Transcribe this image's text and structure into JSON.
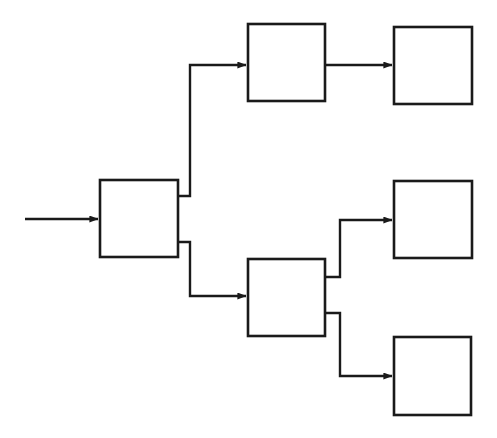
{
  "diagram": {
    "type": "flowchart",
    "orientation": "left-to-right",
    "canvas": {
      "width": 497,
      "height": 438,
      "background": "#ffffff"
    },
    "style": {
      "stroke_color": "#1a1a1a",
      "box_fill": "#ffffff",
      "box_stroke_width": 2.6,
      "edge_stroke_width": 2.4,
      "arrowhead": "solid-triangle"
    },
    "nodes": [
      {
        "id": "n1",
        "name": "root-block",
        "label": "",
        "x": 100,
        "y": 180,
        "width": 78,
        "height": 77
      },
      {
        "id": "n2",
        "name": "upper-branch-block",
        "label": "",
        "x": 248,
        "y": 24,
        "width": 77,
        "height": 77
      },
      {
        "id": "n3",
        "name": "upper-terminal-block",
        "label": "",
        "x": 394,
        "y": 27,
        "width": 78,
        "height": 77
      },
      {
        "id": "n4",
        "name": "lower-branch-block",
        "label": "",
        "x": 248,
        "y": 259,
        "width": 77,
        "height": 77
      },
      {
        "id": "n5",
        "name": "lower-upper-terminal-block",
        "label": "",
        "x": 394,
        "y": 181,
        "width": 78,
        "height": 77
      },
      {
        "id": "n6",
        "name": "lower-lower-terminal-block",
        "label": "",
        "x": 394,
        "y": 337,
        "width": 77,
        "height": 78
      }
    ],
    "edges": [
      {
        "id": "e0",
        "name": "input-arrow",
        "label": "",
        "from": "input",
        "to": "n1",
        "kind": "straight",
        "points": "25,219 98,219"
      },
      {
        "id": "e1",
        "name": "root-to-upper-branch-edge",
        "label": "",
        "from": "n1",
        "to": "n2",
        "kind": "orthogonal",
        "points": "178,196 190,196 190,65 246,65"
      },
      {
        "id": "e2",
        "name": "root-to-lower-branch-edge",
        "label": "",
        "from": "n1",
        "to": "n4",
        "kind": "orthogonal",
        "points": "178,242 190,242 190,296 246,296"
      },
      {
        "id": "e3",
        "name": "upper-branch-to-terminal-edge",
        "label": "",
        "from": "n2",
        "to": "n3",
        "kind": "straight",
        "points": "325,65 392,65"
      },
      {
        "id": "e4",
        "name": "lower-branch-to-upper-terminal-edge",
        "label": "",
        "from": "n4",
        "to": "n5",
        "kind": "orthogonal",
        "points": "325,277 340,277 340,220 392,220"
      },
      {
        "id": "e5",
        "name": "lower-branch-to-lower-terminal-edge",
        "label": "",
        "from": "n4",
        "to": "n6",
        "kind": "orthogonal",
        "points": "325,313 340,313 340,376 392,376"
      }
    ],
    "counts": {
      "nodes": 6,
      "edges": 6,
      "branch_points": 2
    }
  }
}
